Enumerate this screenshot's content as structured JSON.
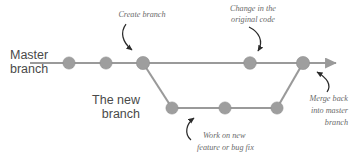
{
  "diagram": {
    "type": "git-branching-diagram",
    "colors": {
      "line": "#9a9a9a",
      "node": "#9e9e9e",
      "annotation_text": "#6a6a6a",
      "branch_label_text": "#4a4a4a",
      "arrow": "#2b2b2b",
      "background": "#ffffff"
    },
    "branches": [
      {
        "id": "master",
        "label_line1": "Master",
        "label_line2": "branch",
        "y": 63,
        "commits": [
          69,
          106,
          143,
          250,
          303
        ],
        "line_start_x": 30,
        "line_end_x": 340
      },
      {
        "id": "feature",
        "label_line1": "The new",
        "label_line2": "branch",
        "y": 108,
        "commits": [
          172,
          225,
          277
        ],
        "line_start_x": 172,
        "line_end_x": 277
      }
    ],
    "annotations": [
      {
        "id": "create-branch",
        "lines": [
          "Create branch"
        ],
        "anchor_x": 142,
        "anchor_y": 17
      },
      {
        "id": "change-original-code",
        "lines": [
          "Change in the",
          "original code"
        ],
        "anchor_x": 253,
        "anchor_y": 11
      },
      {
        "id": "work-on-new-feature",
        "lines": [
          "Work on new",
          "feature or bug fix"
        ],
        "anchor_x": 243,
        "anchor_y": 137
      },
      {
        "id": "merge-back",
        "lines": [
          "Merge back",
          "into master",
          "branch"
        ],
        "anchor_x": 348,
        "anchor_y": 99
      }
    ]
  }
}
